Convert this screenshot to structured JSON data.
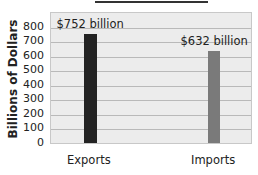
{
  "chart_data": {
    "type": "bar",
    "title": "",
    "categories": [
      "Exports",
      "Imports"
    ],
    "values": [
      752,
      632
    ],
    "data_labels": [
      "$752 billion",
      "$632 billion"
    ],
    "colors": [
      "#232323",
      "#7a7a7a"
    ],
    "xlabel": "",
    "ylabel": "Billions of Dollars",
    "yticks": [
      "0",
      "100",
      "200",
      "300",
      "400",
      "500",
      "600",
      "700",
      "800"
    ],
    "ylim": [
      0,
      900
    ],
    "grid": true,
    "legend": null
  }
}
